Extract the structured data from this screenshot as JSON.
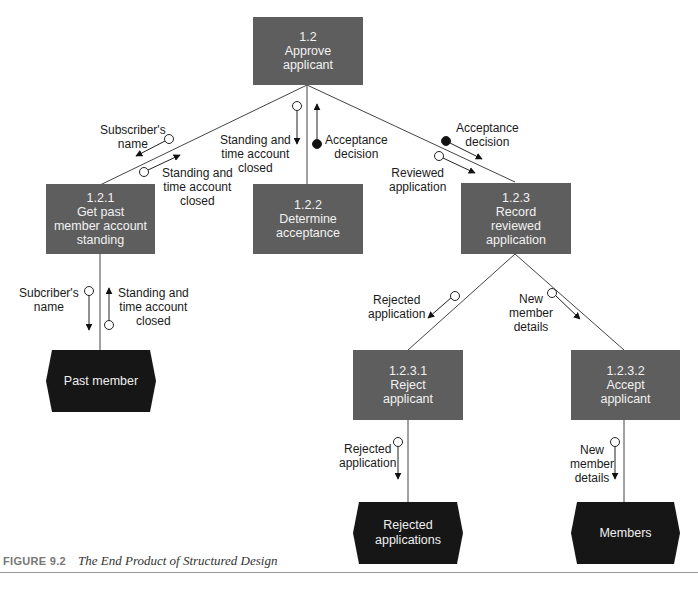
{
  "figure": {
    "label": "FIGURE 9.2",
    "title": "The End Product of Structured Design"
  },
  "colors": {
    "module_fill": "#5e5e5e",
    "store_fill": "#161616",
    "line": "#333333",
    "text_on_dark": "#f2f2f2"
  },
  "modules": [
    {
      "id": "1.2",
      "lines": [
        "1.2",
        "Approve",
        "applicant"
      ]
    },
    {
      "id": "1.2.1",
      "lines": [
        "1.2.1",
        "Get past",
        "member account",
        "standing"
      ]
    },
    {
      "id": "1.2.2",
      "lines": [
        "1.2.2",
        "Determine",
        "acceptance"
      ]
    },
    {
      "id": "1.2.3",
      "lines": [
        "1.2.3",
        "Record",
        "reviewed",
        "application"
      ]
    },
    {
      "id": "1.2.3.1",
      "lines": [
        "1.2.3.1",
        "Reject",
        "applicant"
      ]
    },
    {
      "id": "1.2.3.2",
      "lines": [
        "1.2.3.2",
        "Accept",
        "applicant"
      ]
    }
  ],
  "stores": [
    {
      "lines": [
        "Past member"
      ]
    },
    {
      "lines": [
        "Rejected",
        "applications"
      ]
    },
    {
      "lines": [
        "Members"
      ]
    }
  ],
  "flows": [
    {
      "lines": [
        "Subscriber's",
        "name"
      ],
      "type": "data"
    },
    {
      "lines": [
        "Standing and",
        "time account",
        "closed"
      ],
      "type": "data"
    },
    {
      "lines": [
        "Standing and",
        "time account",
        "closed"
      ],
      "type": "data"
    },
    {
      "lines": [
        "Acceptance",
        "decision"
      ],
      "type": "control"
    },
    {
      "lines": [
        "Acceptance",
        "decision"
      ],
      "type": "control"
    },
    {
      "lines": [
        "Reviewed",
        "application"
      ],
      "type": "data"
    },
    {
      "lines": [
        "Subcriber's",
        "name"
      ],
      "type": "data"
    },
    {
      "lines": [
        "Standing and",
        "time account",
        "closed"
      ],
      "type": "data"
    },
    {
      "lines": [
        "Rejected",
        "application"
      ],
      "type": "data"
    },
    {
      "lines": [
        "New",
        "member",
        "details"
      ],
      "type": "data"
    },
    {
      "lines": [
        "Rejected",
        "application"
      ],
      "type": "data"
    },
    {
      "lines": [
        "New",
        "member",
        "details"
      ],
      "type": "data"
    }
  ]
}
